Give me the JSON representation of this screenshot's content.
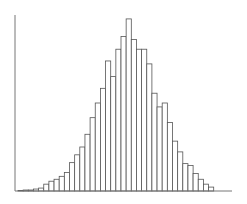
{
  "chart_data": {
    "type": "bar",
    "title": "",
    "xlabel": "",
    "ylabel": "",
    "grid": false,
    "legend": null,
    "bar_style": {
      "fill": "#ffffff",
      "stroke": "#555555"
    },
    "ylim": [
      0,
      180
    ],
    "categories": [
      "1",
      "2",
      "3",
      "4",
      "5",
      "6",
      "7",
      "8",
      "9",
      "10",
      "11",
      "12",
      "13",
      "14",
      "15",
      "16",
      "17",
      "18",
      "19",
      "20",
      "21",
      "22",
      "23",
      "24",
      "25",
      "26",
      "27",
      "28",
      "29",
      "30",
      "31",
      "32",
      "33",
      "34",
      "35",
      "36",
      "37",
      "38"
    ],
    "values": [
      0.5,
      1,
      1,
      2,
      3,
      7,
      10,
      12,
      15,
      19,
      29,
      37,
      45,
      58,
      75,
      90,
      105,
      133,
      117,
      145,
      158,
      176,
      155,
      145,
      145,
      130,
      100,
      86,
      90,
      70,
      51,
      40,
      28,
      26,
      18,
      12,
      7,
      4
    ],
    "layout": {
      "x0": 18,
      "bar_width": 5.15,
      "baseline_y": 191,
      "axis_top_y": 15,
      "axis_x": 15,
      "axis_right_x": 232
    }
  }
}
